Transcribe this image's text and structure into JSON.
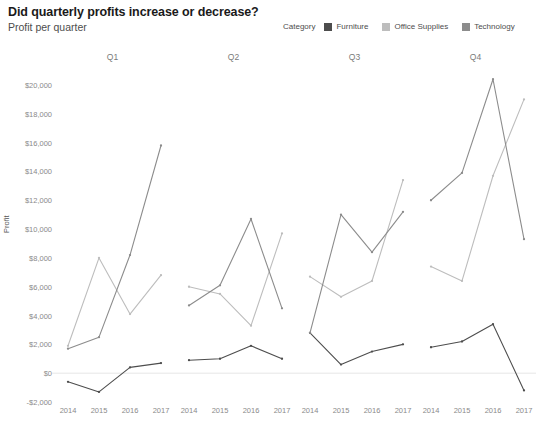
{
  "header": {
    "title": "Did quarterly profits increase or decrease?",
    "subtitle": "Profit per quarter"
  },
  "legend": {
    "title": "Category",
    "position": "top-right",
    "items": [
      {
        "label": "Furniture",
        "color": "#4d4d4d"
      },
      {
        "label": "Office Supplies",
        "color": "#bdbdbd"
      },
      {
        "label": "Technology",
        "color": "#8c8c8c"
      }
    ]
  },
  "chart_data": {
    "type": "line",
    "title": "Did quarterly profits increase or decrease?",
    "subtitle": "Profit per quarter",
    "xlabel": "",
    "ylabel": "Profit",
    "ylim": [
      -2000,
      20000
    ],
    "ytick_step": 2000,
    "ytick_labels": [
      "$20,000",
      "$18,000",
      "$16,000",
      "$14,000",
      "$12,000",
      "$10,000",
      "$8,000",
      "$6,000",
      "$4,000",
      "$2,000",
      "$0",
      "-$2,000"
    ],
    "ytick_values": [
      20000,
      18000,
      16000,
      14000,
      12000,
      10000,
      8000,
      6000,
      4000,
      2000,
      0,
      -2000
    ],
    "grid": false,
    "zero_line": true,
    "x": [
      "2014",
      "2015",
      "2016",
      "2017"
    ],
    "panels": [
      {
        "label": "Q1",
        "series": [
          {
            "name": "Furniture",
            "color": "#4d4d4d",
            "values": [
              -600,
              -1300,
              400,
              700
            ]
          },
          {
            "name": "Office Supplies",
            "color": "#bdbdbd",
            "values": [
              1900,
              8000,
              4100,
              6800
            ]
          },
          {
            "name": "Technology",
            "color": "#8c8c8c",
            "values": [
              1700,
              2500,
              8200,
              15800
            ]
          }
        ]
      },
      {
        "label": "Q2",
        "series": [
          {
            "name": "Furniture",
            "color": "#4d4d4d",
            "values": [
              900,
              1000,
              1900,
              1000
            ]
          },
          {
            "name": "Office Supplies",
            "color": "#bdbdbd",
            "values": [
              6000,
              5500,
              3300,
              9700
            ]
          },
          {
            "name": "Technology",
            "color": "#8c8c8c",
            "values": [
              4700,
              6100,
              10700,
              4500
            ]
          }
        ]
      },
      {
        "label": "Q3",
        "series": [
          {
            "name": "Furniture",
            "color": "#4d4d4d",
            "values": [
              2800,
              600,
              1500,
              2000
            ]
          },
          {
            "name": "Office Supplies",
            "color": "#bdbdbd",
            "values": [
              6700,
              5300,
              6400,
              13400
            ]
          },
          {
            "name": "Technology",
            "color": "#8c8c8c",
            "values": [
              2800,
              11000,
              8400,
              11200
            ]
          }
        ]
      },
      {
        "label": "Q4",
        "series": [
          {
            "name": "Furniture",
            "color": "#4d4d4d",
            "values": [
              1800,
              2200,
              3400,
              -1200
            ]
          },
          {
            "name": "Office Supplies",
            "color": "#bdbdbd",
            "values": [
              7400,
              6400,
              13700,
              19000
            ]
          },
          {
            "name": "Technology",
            "color": "#8c8c8c",
            "values": [
              12000,
              13900,
              20400,
              9300
            ]
          }
        ]
      }
    ]
  }
}
